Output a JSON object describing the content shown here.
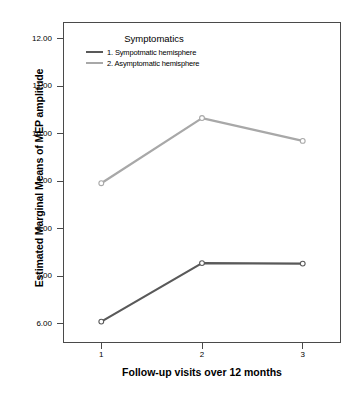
{
  "chart_data": {
    "type": "line",
    "title": "",
    "xlabel": "Follow-up visits over 12 months",
    "ylabel": "Estimated Marginal Means of MEP amplitude",
    "legend_title": "Symptomatics",
    "legend_position": "inside-top-left",
    "grid": false,
    "categories": [
      "1",
      "2",
      "3"
    ],
    "x": [
      1,
      2,
      3
    ],
    "xlim": [
      0.62,
      3.38
    ],
    "ylim": [
      5.6,
      12.35
    ],
    "yticks": [
      "12.00",
      "11.00",
      "10.00",
      "9.00",
      "8.00",
      "7.00",
      "6.00"
    ],
    "ytick_values": [
      12.0,
      11.0,
      10.0,
      9.0,
      8.0,
      7.0,
      6.0
    ],
    "xticks": [
      "1",
      "2",
      "3"
    ],
    "marker": "open-circle",
    "series": [
      {
        "name": "1. Sympotmatic hemisphere",
        "color": "#595959",
        "values": [
          6.05,
          7.28,
          7.27
        ]
      },
      {
        "name": "2. Asymptomatic hemisphere",
        "color": "#a8a8a8",
        "values": [
          8.96,
          10.33,
          9.85
        ]
      }
    ]
  },
  "colors": {
    "series1": "#595959",
    "series2": "#a8a8a8",
    "axis": "#4a4a4a",
    "text": "#000000",
    "background": "#ffffff"
  }
}
